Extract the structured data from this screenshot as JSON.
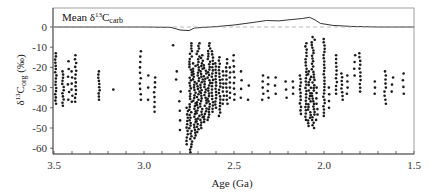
{
  "chart_data": {
    "type": "scatter",
    "title": "",
    "xlabel": "Age (Ga)",
    "ylabel": "δ13Corg (‰)",
    "xlim": [
      3.5,
      1.5
    ],
    "ylim": [
      -63,
      8
    ],
    "x_reversed": true,
    "grid": false,
    "x_ticks": [
      "3.5",
      "3.0",
      "2.5",
      "2.0",
      "1.5"
    ],
    "x_tick_values": [
      3.5,
      3.0,
      2.5,
      2.0,
      1.5
    ],
    "y_ticks": [
      "0",
      "-10",
      "-20",
      "-30",
      "-40",
      "-50",
      "-60"
    ],
    "y_tick_values": [
      0,
      -10,
      -20,
      -30,
      -40,
      -50,
      -60
    ],
    "legend": {
      "label_main": "Mean δ",
      "label_sup": "13",
      "label_c": "C",
      "label_sub": "carb",
      "position": "top-left"
    },
    "series": [
      {
        "name": "Mean δ13Ccarb",
        "kind": "line",
        "points": [
          [
            3.5,
            0
          ],
          [
            3.3,
            0
          ],
          [
            3.0,
            0
          ],
          [
            2.85,
            -0.2
          ],
          [
            2.8,
            -1.5
          ],
          [
            2.75,
            -1.8
          ],
          [
            2.72,
            -0.5
          ],
          [
            2.6,
            0.2
          ],
          [
            2.5,
            1.0
          ],
          [
            2.4,
            2.2
          ],
          [
            2.32,
            3.2
          ],
          [
            2.25,
            3.0
          ],
          [
            2.2,
            3.5
          ],
          [
            2.12,
            4.2
          ],
          [
            2.08,
            4.8
          ],
          [
            2.05,
            3.5
          ],
          [
            2.02,
            1.8
          ],
          [
            1.95,
            0.8
          ],
          [
            1.85,
            0.3
          ],
          [
            1.7,
            0
          ],
          [
            1.5,
            0
          ]
        ]
      },
      {
        "name": "zero-reference",
        "kind": "dashed",
        "points": [
          [
            3.5,
            0
          ],
          [
            1.5,
            0
          ]
        ]
      },
      {
        "name": "δ13Corg",
        "kind": "scatter",
        "columns": [
          [
            3.49,
            -13,
            -38,
            1.0
          ],
          [
            3.45,
            -22,
            -39,
            1.0
          ],
          [
            3.42,
            -17,
            -36,
            0.4
          ],
          [
            3.4,
            -22,
            -37,
            0.5
          ],
          [
            3.38,
            -14,
            -37,
            0.8
          ],
          [
            3.25,
            -22,
            -36,
            1.0
          ],
          [
            3.17,
            -31,
            -31,
            0.1
          ],
          [
            3.02,
            -12,
            -36,
            0.6
          ],
          [
            2.98,
            -24,
            -36,
            0.3
          ],
          [
            2.94,
            -25,
            -42,
            0.7
          ],
          [
            2.84,
            -9,
            -9,
            0.1
          ],
          [
            2.82,
            -22,
            -26,
            0.3
          ],
          [
            2.8,
            -32,
            -51,
            0.3
          ],
          [
            2.76,
            -40,
            -58,
            1.0
          ],
          [
            2.74,
            -8,
            -62,
            1.2
          ],
          [
            2.72,
            -18,
            -55,
            1.2
          ],
          [
            2.7,
            -8,
            -52,
            1.2
          ],
          [
            2.68,
            -14,
            -50,
            1.2
          ],
          [
            2.66,
            -19,
            -47,
            1.2
          ],
          [
            2.64,
            -8,
            -46,
            1.2
          ],
          [
            2.62,
            -12,
            -42,
            1.0
          ],
          [
            2.6,
            -18,
            -40,
            1.0
          ],
          [
            2.58,
            -15,
            -44,
            1.0
          ],
          [
            2.56,
            -22,
            -38,
            0.8
          ],
          [
            2.54,
            -16,
            -38,
            0.8
          ],
          [
            2.52,
            -20,
            -35,
            0.6
          ],
          [
            2.5,
            -14,
            -36,
            0.6
          ],
          [
            2.46,
            -22,
            -35,
            0.4
          ],
          [
            2.42,
            -29,
            -36,
            0.3
          ],
          [
            2.34,
            -24,
            -36,
            0.5
          ],
          [
            2.31,
            -25,
            -35,
            0.5
          ],
          [
            2.27,
            -25,
            -33,
            0.4
          ],
          [
            2.21,
            -27,
            -35,
            0.4
          ],
          [
            2.17,
            -27,
            -33,
            0.4
          ],
          [
            2.13,
            -24,
            -43,
            0.9
          ],
          [
            2.1,
            -8,
            -46,
            1.0
          ],
          [
            2.08,
            -22,
            -49,
            1.2
          ],
          [
            2.06,
            -5,
            -50,
            1.2
          ],
          [
            2.04,
            -30,
            -46,
            0.6
          ],
          [
            2.0,
            -6,
            -44,
            1.0
          ],
          [
            1.97,
            -30,
            -40,
            0.4
          ],
          [
            1.93,
            -14,
            -33,
            0.8
          ],
          [
            1.9,
            -23,
            -36,
            0.8
          ],
          [
            1.87,
            -24,
            -33,
            0.6
          ],
          [
            1.83,
            -14,
            -24,
            0.4
          ],
          [
            1.8,
            -13,
            -32,
            0.8
          ],
          [
            1.72,
            -27,
            -33,
            0.4
          ],
          [
            1.66,
            -22,
            -38,
            0.8
          ],
          [
            1.62,
            -25,
            -32,
            0.4
          ],
          [
            1.56,
            -23,
            -33,
            0.5
          ]
        ]
      }
    ]
  },
  "colors": {
    "points": "#1a1a1a",
    "line": "#333333",
    "dashed": "#aaaaaa",
    "axis": "#444444",
    "frame": "#888888"
  }
}
